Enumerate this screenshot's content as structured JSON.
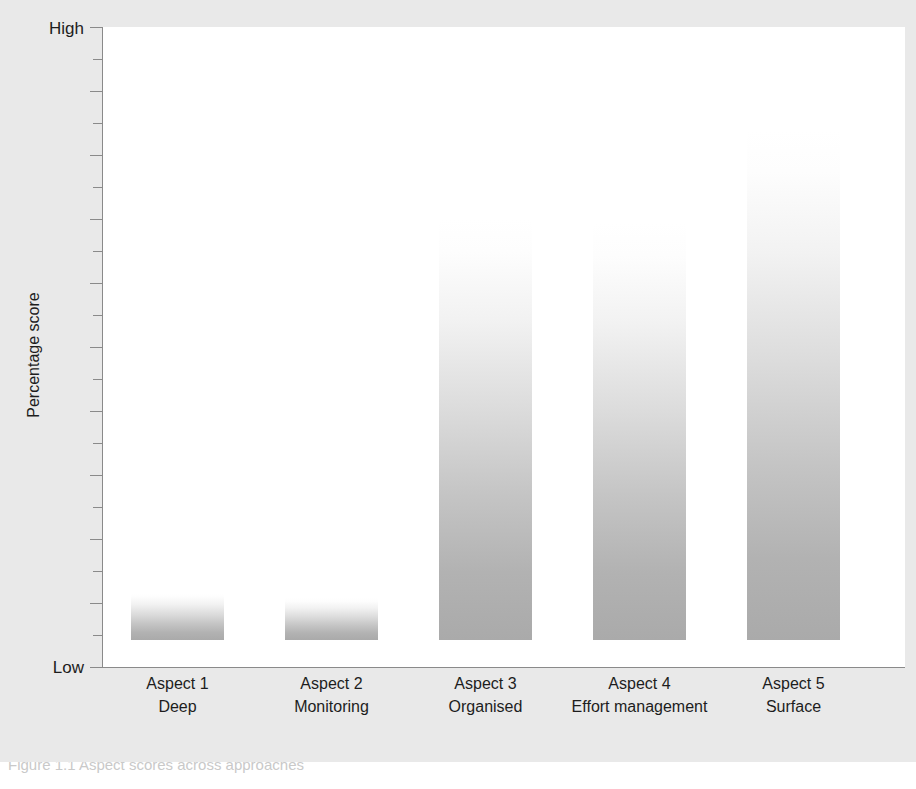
{
  "chart_data": {
    "type": "bar",
    "title": "",
    "xlabel": "",
    "ylabel": "Percentage score",
    "categories": [
      "Aspect 1",
      "Aspect 2",
      "Aspect 3",
      "Aspect 4",
      "Aspect 5"
    ],
    "category_names": [
      "Deep",
      "Monitoring",
      "Organised",
      "Effort management",
      "Surface"
    ],
    "values": [
      7.3,
      6.6,
      66.0,
      65.4,
      80.0
    ],
    "ylim": [
      0,
      100
    ],
    "ytick_labels": [
      "Low",
      "High"
    ],
    "ytick_count": 21,
    "grid": false,
    "legend": false,
    "bar_style": "vertical-gradient-white-to-grey"
  },
  "axes": {
    "y_high_label": "High",
    "y_low_label": "Low",
    "y_title": "Percentage score"
  },
  "bars": [
    {
      "code": "Aspect 1",
      "name": "Deep",
      "value": 7.3,
      "left": 131,
      "width": 93,
      "top": 620
    },
    {
      "code": "Aspect 2",
      "name": "Monitoring",
      "value": 6.6,
      "left": 285,
      "width": 93,
      "top": 625
    },
    {
      "code": "Aspect 3",
      "name": "Organised",
      "value": 66.0,
      "left": 439,
      "width": 93,
      "top": 245
    },
    {
      "code": "Aspect 4",
      "name": "Effort management",
      "value": 65.4,
      "left": 593,
      "width": 93,
      "top": 249
    },
    {
      "code": "Aspect 5",
      "name": "Surface",
      "value": 80.0,
      "left": 747,
      "width": 93,
      "top": 158
    }
  ],
  "colors": {
    "figure_background": "#e9e9e9",
    "plot_background": "#ffffff",
    "axis": "#8a8a8a",
    "bar_base": "#aaaaaa",
    "bar_top": "#ffffff",
    "text": "#1d1d1d"
  },
  "caption": {
    "text": "Figure 1.1  Aspect scores across approaches"
  }
}
